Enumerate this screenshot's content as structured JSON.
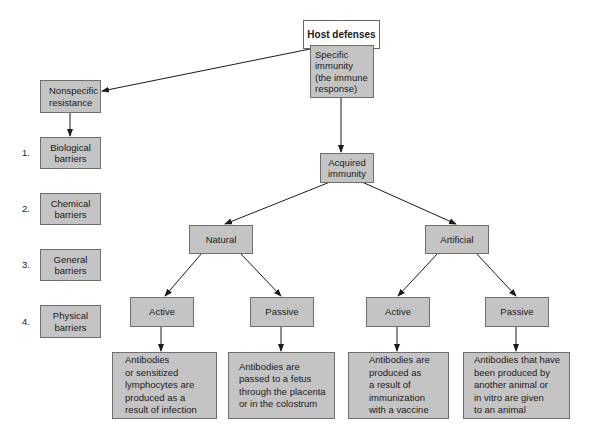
{
  "title": "Host defenses",
  "nonspecific": {
    "label": "Nonspecific\nresistance",
    "items": [
      {
        "num": "1.",
        "label": "Biological\nbarriers"
      },
      {
        "num": "2.",
        "label": "Chemical\nbarriers"
      },
      {
        "num": "3.",
        "label": "General\nbarriers"
      },
      {
        "num": "4.",
        "label": "Physical\nbarriers"
      }
    ]
  },
  "specific": {
    "label": "Specific\nimmunity\n(the immune\nresponse)",
    "acquired": "Acquired\nimmunity",
    "natural": {
      "label": "Natural",
      "active": {
        "label": "Active",
        "desc": "Antibodies\nor sensitized\nlymphocytes are\nproduced as a\nresult of infection"
      },
      "passive": {
        "label": "Passive",
        "desc": "Antibodies are\npassed to a fetus\nthrough the placenta\nor in the colostrum"
      }
    },
    "artificial": {
      "label": "Artificial",
      "active": {
        "label": "Active",
        "desc": "Antibodies are\nproduced as\na result of\nimmunization\nwith a vaccine"
      },
      "passive": {
        "label": "Passive",
        "desc": "Antibodies that have\nbeen produced by\nanother animal or\nin vitro are given\nto an animal"
      }
    }
  },
  "colors": {
    "box_fill": "#c4c4c4",
    "box_border": "#6f6f6f",
    "root_fill": "#ffffff",
    "line": "#1a1a1a"
  }
}
